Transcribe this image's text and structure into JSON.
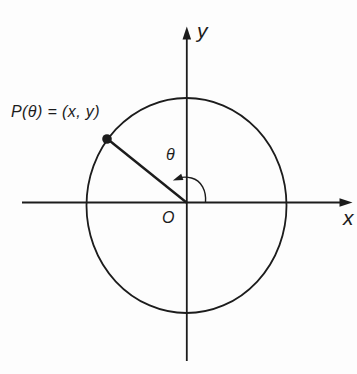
{
  "figure": {
    "labels": {
      "point": "P(θ) = (x, y)",
      "angle": "θ",
      "origin": "O",
      "x_axis": "x",
      "y_axis": "y"
    },
    "colors": {
      "ink": "#1c1c1c",
      "background": "#fdfdfd"
    }
  }
}
